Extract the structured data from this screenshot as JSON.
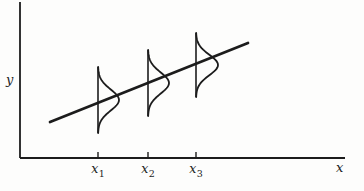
{
  "labels": {
    "y_axis": "y",
    "x_axis": "x",
    "ticks": [
      {
        "base": "x",
        "sub": "1"
      },
      {
        "base": "x",
        "sub": "2"
      },
      {
        "base": "x",
        "sub": "3"
      }
    ]
  },
  "colors": {
    "ink": "#1c1c1c",
    "background": "#fdfdfc"
  },
  "diagram": {
    "axes": {
      "origin_x": 20,
      "origin_y": 158,
      "y_top": 2,
      "x_right": 345
    },
    "tick_xs": [
      98,
      148,
      196
    ],
    "tick_len": 6,
    "tick_label_y": 173,
    "regression_line": {
      "x1": 50,
      "y1": 122,
      "x2": 248,
      "y2": 43
    },
    "curves": [
      {
        "x": 98,
        "center": 100,
        "half": 33,
        "amp": 21
      },
      {
        "x": 148,
        "center": 83,
        "half": 33,
        "amp": 21
      },
      {
        "x": 196,
        "center": 65,
        "half": 32,
        "amp": 22
      }
    ]
  }
}
